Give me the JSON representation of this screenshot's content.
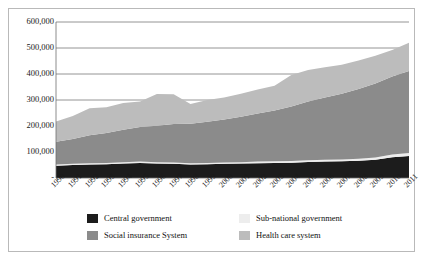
{
  "chart_data": {
    "type": "area",
    "stacked": true,
    "title": "",
    "subtitle": "",
    "xlabel": "",
    "ylabel": "",
    "ylim": [
      0,
      600000
    ],
    "yticks": [
      0,
      100000,
      200000,
      300000,
      400000,
      500000,
      600000
    ],
    "ytick_labels": [
      "-",
      "100,000",
      "200,000",
      "300,000",
      "400,000",
      "500,000",
      "600,000"
    ],
    "grid": "horizontal",
    "legend_position": "bottom",
    "categories": [
      "1990",
      "1991",
      "1992",
      "1993",
      "1994",
      "1995",
      "1996",
      "1997",
      "1998",
      "1999",
      "2000",
      "2001",
      "2002",
      "2003",
      "2004",
      "2005",
      "2006",
      "2007",
      "2008",
      "2009",
      "2010",
      "2011"
    ],
    "series": [
      {
        "name": "Central government",
        "color": "#1c1c1c",
        "values": [
          47000,
          50000,
          52000,
          53000,
          56000,
          58000,
          56000,
          55000,
          52000,
          53000,
          55000,
          56000,
          57000,
          58000,
          59000,
          62000,
          63000,
          64000,
          66000,
          70000,
          80000,
          85000
        ]
      },
      {
        "name": "Sub-national government",
        "color": "#ededed",
        "values": [
          5000,
          5000,
          5000,
          5000,
          5000,
          5000,
          5000,
          5000,
          5000,
          5000,
          5000,
          5000,
          6000,
          6000,
          6000,
          6000,
          7000,
          7000,
          8000,
          9000,
          10000,
          11000
        ]
      },
      {
        "name": "Social insurance System",
        "color": "#8b8b8b",
        "values": [
          87000,
          95000,
          107000,
          115000,
          125000,
          133000,
          140000,
          148000,
          152000,
          158000,
          165000,
          175000,
          185000,
          196000,
          210000,
          226000,
          240000,
          253000,
          268000,
          284000,
          300000,
          316000
        ]
      },
      {
        "name": "Health care system",
        "color": "#bcbcbc",
        "values": [
          78000,
          88000,
          104000,
          99000,
          102000,
          98000,
          122000,
          114000,
          76000,
          84000,
          85000,
          88000,
          92000,
          95000,
          121000,
          121000,
          116000,
          112000,
          110000,
          107000,
          102000,
          108000
        ]
      }
    ],
    "stack_order": [
      "Central government",
      "Sub-national government",
      "Social insurance System",
      "Health care system"
    ],
    "totals": [
      217000,
      238000,
      268000,
      272000,
      288000,
      294000,
      323000,
      322000,
      285000,
      300000,
      310000,
      324000,
      340000,
      355000,
      396000,
      415000,
      426000,
      436000,
      452000,
      470000,
      492000,
      520000
    ]
  },
  "legend": {
    "items": [
      {
        "label": "Central government",
        "color": "#1c1c1c"
      },
      {
        "label": "Sub-national government",
        "color": "#ededed"
      },
      {
        "label": "Social insurance System",
        "color": "#8b8b8b"
      },
      {
        "label": "Health care system",
        "color": "#bcbcbc"
      }
    ]
  },
  "colors": {
    "frame": "#b9b9b9",
    "gridline": "#7a7a7a",
    "axis": "#6e6e6e",
    "background": "#ffffff",
    "text": "#1a1a1a"
  }
}
